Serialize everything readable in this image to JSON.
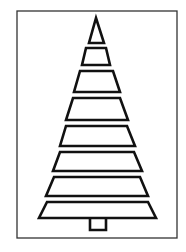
{
  "image": {
    "subject": "christmas-tree-outline",
    "colors": {
      "background": "#ffffff",
      "stroke": "#111111",
      "frame": "#333333"
    }
  },
  "tree": {
    "tiers": 7,
    "has_top_triangle": true,
    "has_trunk": true
  }
}
